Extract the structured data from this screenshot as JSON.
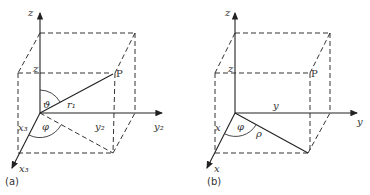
{
  "figure": {
    "panel_a": {
      "caption": "(a)",
      "axes": {
        "z": "z",
        "y": "y₂",
        "x": "x₃"
      },
      "labels": {
        "z_proj": "z",
        "point": "P",
        "theta": "ϑ",
        "radius": "r₁",
        "phi": "φ",
        "y_proj": "y₂",
        "x_proj": "x₃"
      }
    },
    "panel_b": {
      "caption": "(b)",
      "axes": {
        "z": "z",
        "y": "y",
        "x": "x"
      },
      "labels": {
        "z_proj": "z",
        "point": "P",
        "phi": "φ",
        "rho": "ρ",
        "y_proj": "y",
        "x_proj": "x"
      }
    }
  }
}
